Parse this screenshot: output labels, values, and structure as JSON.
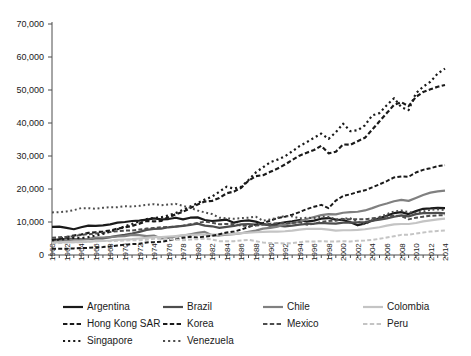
{
  "chart_data": {
    "type": "line",
    "title": "",
    "xlabel": "",
    "ylabel": "",
    "ylim": [
      0,
      70000
    ],
    "xlim": [
      1960,
      2014
    ],
    "ytick_labels": [
      "70,000",
      "60,000",
      "50,000",
      "40,000",
      "30,000",
      "20,000",
      "10,000",
      "0"
    ],
    "ytick_values": [
      70000,
      60000,
      50000,
      40000,
      30000,
      20000,
      10000,
      0
    ],
    "xtick_labels": [
      "1960",
      "1962",
      "1964",
      "1966",
      "1968",
      "1970",
      "1972",
      "1974",
      "1976",
      "1978",
      "1980",
      "1982",
      "1984",
      "1986",
      "1988",
      "1990",
      "1992",
      "1994",
      "1996",
      "1998",
      "2000",
      "2002",
      "2004",
      "2006",
      "2008",
      "2010",
      "2012",
      "2014"
    ],
    "grid": false,
    "legend_position": "bottom",
    "x": [
      1960,
      1961,
      1962,
      1963,
      1964,
      1965,
      1966,
      1967,
      1968,
      1969,
      1970,
      1971,
      1972,
      1973,
      1974,
      1975,
      1976,
      1977,
      1978,
      1979,
      1980,
      1981,
      1982,
      1983,
      1984,
      1985,
      1986,
      1987,
      1988,
      1989,
      1990,
      1991,
      1992,
      1993,
      1994,
      1995,
      1996,
      1997,
      1998,
      1999,
      2000,
      2001,
      2002,
      2003,
      2004,
      2005,
      2006,
      2007,
      2008,
      2009,
      2010,
      2011,
      2012,
      2013,
      2014
    ],
    "series": [
      {
        "name": "Argentina",
        "style": "solid",
        "color": "#1a1a1a",
        "width": 2.2,
        "values": [
          8500,
          8600,
          8200,
          7800,
          8400,
          8900,
          8800,
          9000,
          9300,
          9800,
          10000,
          10300,
          10400,
          10700,
          11100,
          10800,
          10900,
          11300,
          10800,
          11300,
          11400,
          10600,
          10300,
          10500,
          10700,
          9800,
          10300,
          10500,
          10100,
          9400,
          9000,
          9500,
          9900,
          10200,
          10600,
          10100,
          10400,
          11000,
          11200,
          10700,
          10600,
          9900,
          9000,
          9600,
          10400,
          11100,
          11900,
          12700,
          13000,
          12400,
          13300,
          14000,
          14100,
          14300,
          14200
        ]
      },
      {
        "name": "Brazil",
        "style": "solid",
        "color": "#4d4d4d",
        "width": 2.2,
        "values": [
          4500,
          4700,
          4900,
          4800,
          4850,
          4800,
          5000,
          5050,
          5400,
          5800,
          6100,
          6500,
          7000,
          7600,
          7900,
          8000,
          8400,
          8600,
          8800,
          9100,
          9500,
          8900,
          8700,
          8200,
          8500,
          8800,
          9300,
          9400,
          9200,
          9400,
          8900,
          8900,
          8700,
          8900,
          9200,
          9400,
          9500,
          9700,
          9600,
          9500,
          9800,
          9800,
          9900,
          10000,
          10400,
          10700,
          11100,
          11600,
          12000,
          11700,
          12400,
          12700,
          12700,
          12800,
          12600
        ]
      },
      {
        "name": "Chile",
        "style": "solid",
        "color": "#808080",
        "width": 2.2,
        "values": [
          4200,
          4300,
          4500,
          4700,
          4750,
          4900,
          5300,
          5300,
          5400,
          5600,
          5700,
          6100,
          6000,
          5700,
          5900,
          5000,
          5200,
          5600,
          5900,
          6300,
          6700,
          7000,
          6000,
          5900,
          6200,
          6300,
          6600,
          7000,
          7400,
          8000,
          8200,
          8600,
          9300,
          9700,
          10100,
          10900,
          11500,
          12100,
          12400,
          12300,
          12800,
          13000,
          13100,
          13500,
          14200,
          15000,
          15600,
          16300,
          16700,
          16400,
          17300,
          18200,
          18900,
          19300,
          19500
        ]
      },
      {
        "name": "Colombia",
        "style": "solid",
        "color": "#c4c4c4",
        "width": 2.2,
        "values": [
          3800,
          3850,
          3900,
          3900,
          4000,
          4050,
          4200,
          4250,
          4400,
          4600,
          4700,
          4800,
          5000,
          5200,
          5400,
          5400,
          5600,
          5700,
          6000,
          6100,
          6200,
          6200,
          6200,
          6200,
          6300,
          6400,
          6600,
          6800,
          6900,
          7000,
          7100,
          7100,
          7200,
          7400,
          7700,
          7900,
          7900,
          7900,
          7700,
          7400,
          7500,
          7500,
          7600,
          7800,
          8100,
          8400,
          8900,
          9300,
          9400,
          9400,
          9700,
          10200,
          10500,
          10800,
          11000
        ]
      },
      {
        "name": "Hong Kong SAR",
        "style": "dashed",
        "color": "#1a1a1a",
        "width": 2.2,
        "values": [
          4600,
          4900,
          5400,
          5900,
          6200,
          6700,
          6900,
          7100,
          7400,
          8000,
          8400,
          8800,
          9500,
          10300,
          10200,
          10300,
          11500,
          12300,
          13100,
          14200,
          15300,
          16200,
          16400,
          17300,
          18700,
          19200,
          20400,
          22500,
          23900,
          24200,
          25200,
          26200,
          27400,
          28800,
          30100,
          31000,
          31800,
          33100,
          30800,
          31300,
          33500,
          33400,
          34500,
          35500,
          38000,
          40500,
          43000,
          45500,
          46300,
          45100,
          47900,
          49400,
          50200,
          51000,
          51500
        ]
      },
      {
        "name": "Korea",
        "style": "dashed",
        "color": "#1a1a1a",
        "width": 2.0,
        "values": [
          1900,
          1900,
          1900,
          2000,
          2100,
          2150,
          2300,
          2400,
          2600,
          2900,
          3100,
          3300,
          3400,
          3800,
          3900,
          4000,
          4400,
          4800,
          5200,
          5500,
          5300,
          5600,
          5800,
          6300,
          6800,
          7100,
          7700,
          8500,
          9200,
          9700,
          10400,
          11200,
          11600,
          12200,
          13000,
          13900,
          14600,
          15200,
          14200,
          16500,
          17900,
          18400,
          19100,
          19600,
          20500,
          21400,
          22400,
          23500,
          23800,
          23700,
          25000,
          25800,
          26300,
          26900,
          27200
        ]
      },
      {
        "name": "Mexico",
        "style": "dashed",
        "color": "#4d4d4d",
        "width": 2.0,
        "values": [
          5200,
          5400,
          5500,
          5700,
          6100,
          6300,
          6500,
          6700,
          7000,
          7200,
          7400,
          7400,
          7700,
          8000,
          8200,
          8400,
          8500,
          8600,
          8900,
          9300,
          9700,
          10100,
          9800,
          9300,
          9400,
          9400,
          8900,
          8900,
          8900,
          9200,
          9500,
          9600,
          9700,
          9700,
          10000,
          9200,
          9500,
          10000,
          10300,
          10400,
          10900,
          10800,
          10800,
          10800,
          11100,
          11300,
          11700,
          11900,
          11800,
          10800,
          11300,
          11600,
          11900,
          12000,
          12100
        ]
      },
      {
        "name": "Peru",
        "style": "dashed",
        "color": "#c4c4c4",
        "width": 2.0,
        "values": [
          3500,
          3600,
          3800,
          3850,
          3900,
          4000,
          4200,
          4250,
          4200,
          4300,
          4400,
          4500,
          4500,
          4600,
          4900,
          4900,
          4800,
          4700,
          4500,
          4700,
          4800,
          4900,
          4700,
          4200,
          4200,
          4200,
          4400,
          4600,
          4200,
          3800,
          3600,
          3600,
          3500,
          3600,
          3900,
          4100,
          4100,
          4200,
          4100,
          4100,
          4200,
          4100,
          4300,
          4400,
          4600,
          4900,
          5300,
          5700,
          6100,
          6100,
          6500,
          6800,
          7100,
          7300,
          7400
        ]
      },
      {
        "name": "Singapore",
        "style": "dotted",
        "color": "#1a1a1a",
        "width": 2.2,
        "values": [
          4400,
          4700,
          4800,
          5200,
          5100,
          5400,
          5900,
          6400,
          7100,
          7800,
          8700,
          9400,
          10200,
          10900,
          11200,
          11400,
          12000,
          12700,
          13700,
          14700,
          15700,
          16800,
          17700,
          19200,
          20700,
          20100,
          20700,
          22700,
          25000,
          26600,
          28100,
          28900,
          29900,
          31400,
          33000,
          34200,
          35500,
          36800,
          35200,
          37200,
          39800,
          37500,
          37800,
          39300,
          42300,
          43000,
          45400,
          47500,
          44800,
          43900,
          49000,
          51000,
          52500,
          55000,
          56500
        ]
      },
      {
        "name": "Venezuela",
        "style": "dotted",
        "color": "#4d4d4d",
        "width": 2.0,
        "values": [
          12900,
          13000,
          13200,
          13600,
          14200,
          14200,
          14000,
          14300,
          14500,
          14500,
          14800,
          14700,
          14900,
          15200,
          15400,
          15100,
          15300,
          15500,
          14900,
          14300,
          13500,
          12900,
          12400,
          11300,
          11100,
          11000,
          11200,
          11300,
          11600,
          10400,
          10800,
          11300,
          11800,
          11700,
          11100,
          11300,
          11200,
          11600,
          11500,
          10800,
          11000,
          11100,
          10100,
          9200,
          10600,
          11500,
          12400,
          13200,
          13500,
          13000,
          12800,
          13200,
          13700,
          13800,
          13600
        ]
      }
    ]
  },
  "legend": {
    "items": [
      {
        "label": "Argentina",
        "style": "solid",
        "color": "#1a1a1a"
      },
      {
        "label": "Brazil",
        "style": "solid",
        "color": "#4d4d4d"
      },
      {
        "label": "Chile",
        "style": "solid",
        "color": "#808080"
      },
      {
        "label": "Colombia",
        "style": "solid",
        "color": "#c4c4c4"
      },
      {
        "label": "Hong Kong SAR",
        "style": "dashed",
        "color": "#1a1a1a"
      },
      {
        "label": "Korea",
        "style": "dashed",
        "color": "#1a1a1a"
      },
      {
        "label": "Mexico",
        "style": "dashed",
        "color": "#4d4d4d"
      },
      {
        "label": "Peru",
        "style": "dashed",
        "color": "#c4c4c4"
      },
      {
        "label": "Singapore",
        "style": "dotted",
        "color": "#1a1a1a"
      },
      {
        "label": "Venezuela",
        "style": "dotted",
        "color": "#4d4d4d"
      }
    ]
  },
  "colors": {
    "axis": "#4d4d4d",
    "text": "#1a1a1a",
    "background": "#ffffff"
  }
}
